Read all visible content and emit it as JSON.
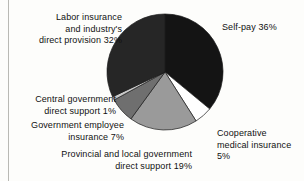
{
  "chart_data": {
    "type": "pie",
    "title": "",
    "subtitle": "",
    "xlabel": "",
    "ylabel": "",
    "legend_position": "labels-around-pie",
    "grid": false,
    "units": "percent",
    "total": 100,
    "categories": [
      "Self-pay",
      "Cooperative medical insurance",
      "Provincial and local government direct support",
      "Government employee insurance",
      "Central government direct support",
      "Labor insurance and industry's direct provision"
    ],
    "values": [
      36,
      5,
      19,
      7,
      1,
      32
    ],
    "slices": [
      {
        "label": "Self-pay",
        "value": 36,
        "value_text": "36%",
        "color": "#141414",
        "label_text": "Self-pay  36%",
        "label_align": "left"
      },
      {
        "label": "Cooperative medical insurance",
        "value": 5,
        "value_text": "5%",
        "color": "#ffffff",
        "label_text": "Cooperative\nmedical insurance\n5%",
        "label_align": "left"
      },
      {
        "label": "Provincial and local government direct support",
        "value": 19,
        "value_text": "19%",
        "color": "#9a9a9a",
        "label_text": "Provincial and local government\ndirect support  19%",
        "label_align": "right"
      },
      {
        "label": "Government employee insurance",
        "value": 7,
        "value_text": "7%",
        "color": "#6f6f6f",
        "label_text": "Government employee\ninsurance  7%",
        "label_align": "right"
      },
      {
        "label": "Central government direct support",
        "value": 1,
        "value_text": "1%",
        "color": "#c9c9c9",
        "label_text": "Central government\ndirect support  1%",
        "label_align": "right"
      },
      {
        "label": "Labor insurance and industry's direct provision",
        "value": 32,
        "value_text": "32%",
        "color": "#262626",
        "label_text": "Labor insurance\nand industry's\ndirect provision  32%",
        "label_align": "right"
      }
    ],
    "geometry": {
      "center_x": 59,
      "center_y": 59,
      "radius": 58,
      "start_angle_deg": 0,
      "direction": "clockwise"
    }
  }
}
